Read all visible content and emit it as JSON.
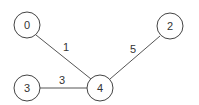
{
  "graph": {
    "nodes": [
      {
        "id": "0",
        "label": "0",
        "x": 27,
        "y": 25
      },
      {
        "id": "3",
        "label": "3",
        "x": 27,
        "y": 88
      },
      {
        "id": "4",
        "label": "4",
        "x": 100,
        "y": 88
      },
      {
        "id": "2",
        "label": "2",
        "x": 170,
        "y": 26
      }
    ],
    "edges": [
      {
        "from": "0",
        "to": "4",
        "weight": "1"
      },
      {
        "from": "3",
        "to": "4",
        "weight": "3"
      },
      {
        "from": "2",
        "to": "4",
        "weight": "5"
      }
    ]
  }
}
